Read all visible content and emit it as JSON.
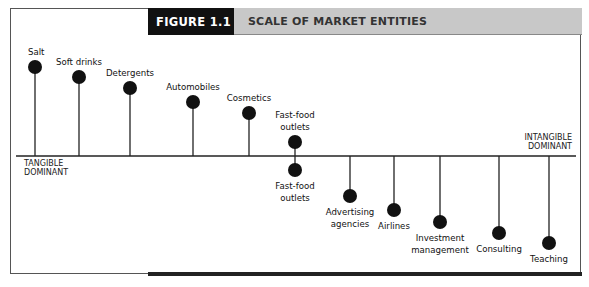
{
  "figure": {
    "number": "FIGURE 1.1",
    "title": "SCALE OF MARKET ENTITIES"
  },
  "axis": {
    "left_label": [
      "TANGIBLE",
      "DOMINANT"
    ],
    "right_label": [
      "INTANGIBLE",
      "DOMINANT"
    ]
  },
  "items": [
    {
      "label": [
        "Salt"
      ],
      "x": 35,
      "y": 67,
      "side": "above"
    },
    {
      "label": [
        "Soft drinks"
      ],
      "x": 79,
      "y": 77,
      "side": "above"
    },
    {
      "label": [
        "Detergents"
      ],
      "x": 130,
      "y": 88,
      "side": "above"
    },
    {
      "label": [
        "Automobiles"
      ],
      "x": 193,
      "y": 102,
      "side": "above"
    },
    {
      "label": [
        "Cosmetics"
      ],
      "x": 249,
      "y": 113,
      "side": "above"
    },
    {
      "label": [
        "Fast-food",
        "outlets"
      ],
      "x": 295,
      "y": 142,
      "side": "above"
    },
    {
      "label": [
        "Fast-food",
        "outlets"
      ],
      "x": 295,
      "y": 170,
      "side": "below"
    },
    {
      "label": [
        "Advertising",
        "agencies"
      ],
      "x": 350,
      "y": 196,
      "side": "below"
    },
    {
      "label": [
        "Airlines"
      ],
      "x": 394,
      "y": 210,
      "side": "below"
    },
    {
      "label": [
        "Investment",
        "management"
      ],
      "x": 440,
      "y": 222,
      "side": "below"
    },
    {
      "label": [
        "Consulting"
      ],
      "x": 499,
      "y": 233,
      "side": "below"
    },
    {
      "label": [
        "Teaching"
      ],
      "x": 549,
      "y": 243,
      "side": "below"
    }
  ],
  "colors": {
    "header_dark": "#111111",
    "header_light": "#c8c8c8",
    "ink": "#111111"
  }
}
